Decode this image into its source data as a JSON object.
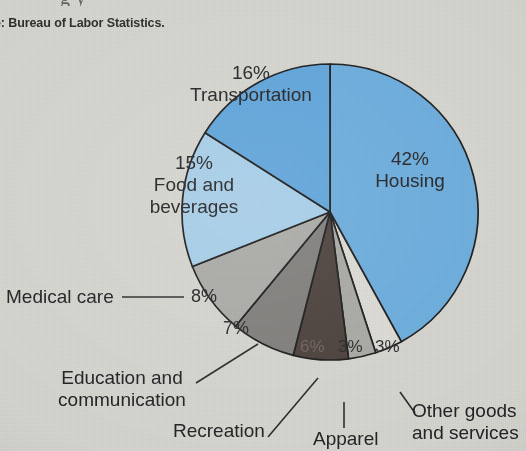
{
  "page": {
    "clipped_headline": "g y",
    "source_note": "e: Bureau of Labor Statistics."
  },
  "colors": {
    "background": "#d6d5cf",
    "housing": "#6badde",
    "transportation": "#5fa5dc",
    "food_and_beverages": "#a7cfea",
    "medical_care": "#aaaaa6",
    "education_and_communication": "#807e7b",
    "recreation": "#4b403b",
    "apparel": "#a9a9a4",
    "other_goods_and_services": "#dcdbd6",
    "outline": "#1b1b1b",
    "text": "#232326"
  },
  "labels": {
    "housing": {
      "pct": "42%",
      "name": "Housing"
    },
    "transportation": {
      "pct": "16%",
      "name": "Transportation"
    },
    "food": {
      "pct": "15%",
      "name_line1": "Food and",
      "name_line2": "beverages"
    },
    "medical": {
      "pct": "8%",
      "name": "Medical care"
    },
    "education": {
      "pct": "7%",
      "name_line1": "Education and",
      "name_line2": "communication"
    },
    "recreation": {
      "pct": "6%",
      "name": "Recreation"
    },
    "apparel": {
      "pct": "3%",
      "name": "Apparel"
    },
    "other": {
      "pct": "3%",
      "name_line1": "Other goods",
      "name_line2": "and services"
    }
  },
  "chart_data": {
    "type": "pie",
    "title": "",
    "subtitle": "",
    "source": "Source: Bureau of Labor Statistics.",
    "units": "percent of consumer spending",
    "start_angle_deg": 0,
    "direction": "clockwise",
    "center": {
      "x": 330,
      "y": 212
    },
    "radius": 148,
    "legend_position": "none",
    "grid": false,
    "labels_on_slices": true,
    "categories": [
      "Housing",
      "Other goods and services",
      "Apparel",
      "Recreation",
      "Education and communication",
      "Medical care",
      "Food and beverages",
      "Transportation"
    ],
    "values": [
      42,
      3,
      3,
      6,
      7,
      8,
      15,
      16
    ],
    "value_labels": [
      "42%",
      "3%",
      "3%",
      "6%",
      "7%",
      "8%",
      "15%",
      "16%"
    ],
    "colors": [
      "#6badde",
      "#dcdbd6",
      "#a9a9a4",
      "#4b403b",
      "#807e7b",
      "#aaaaa6",
      "#a7cfea",
      "#5fa5dc"
    ],
    "total": 100,
    "slices": [
      {
        "name": "Housing",
        "value": 42,
        "label": "42%",
        "color": "#6badde",
        "start_deg": 0.0,
        "end_deg": 151.2,
        "label_placement": "inside"
      },
      {
        "name": "Other goods and services",
        "value": 3,
        "label": "3%",
        "color": "#dcdbd6",
        "start_deg": 151.2,
        "end_deg": 162.0,
        "label_placement": "callout"
      },
      {
        "name": "Apparel",
        "value": 3,
        "label": "3%",
        "color": "#a9a9a4",
        "start_deg": 162.0,
        "end_deg": 172.8,
        "label_placement": "callout"
      },
      {
        "name": "Recreation",
        "value": 6,
        "label": "6%",
        "color": "#4b403b",
        "start_deg": 172.8,
        "end_deg": 194.4,
        "label_placement": "callout"
      },
      {
        "name": "Education and communication",
        "value": 7,
        "label": "7%",
        "color": "#807e7b",
        "start_deg": 194.4,
        "end_deg": 219.6,
        "label_placement": "callout"
      },
      {
        "name": "Medical care",
        "value": 8,
        "label": "8%",
        "color": "#aaaaa6",
        "start_deg": 219.6,
        "end_deg": 248.4,
        "label_placement": "callout"
      },
      {
        "name": "Food and beverages",
        "value": 15,
        "label": "15%",
        "color": "#a7cfea",
        "start_deg": 248.4,
        "end_deg": 302.4,
        "label_placement": "inside"
      },
      {
        "name": "Transportation",
        "value": 16,
        "label": "16%",
        "color": "#5fa5dc",
        "start_deg": 302.4,
        "end_deg": 360.0,
        "label_placement": "inside"
      }
    ]
  }
}
